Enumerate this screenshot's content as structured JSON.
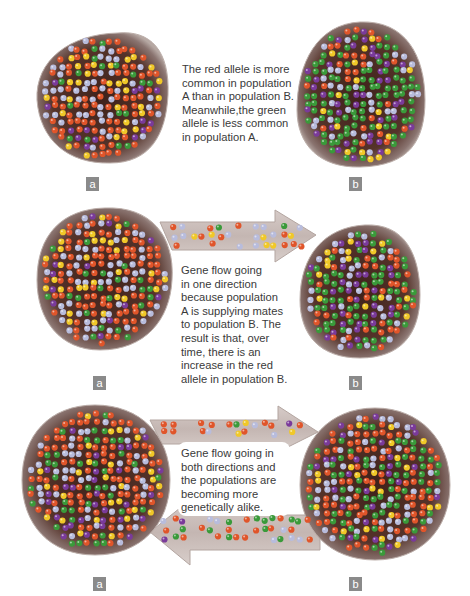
{
  "figure": {
    "colors": {
      "background": "#ffffff",
      "population_fill_inner": "#4a2a22",
      "population_fill_outer": "#9a8680",
      "population_edge": "#b7a9a4",
      "arrow_fill": "#c9bcb8",
      "arrow_edge": "#b3a5a0",
      "label_box": "#8a8a8a",
      "text": "#3a3a3a"
    },
    "alleles": [
      {
        "name": "red",
        "color": "#e0552a"
      },
      {
        "name": "green",
        "color": "#3a9a3a"
      },
      {
        "name": "purple",
        "color": "#7a3a9a"
      },
      {
        "name": "yellow",
        "color": "#f0c828"
      },
      {
        "name": "lavender",
        "color": "#b8bcdc"
      }
    ],
    "panels": [
      {
        "id": "no-gene-flow",
        "caption": "The red allele is more\ncommon in population\nA than in population B.\nMeanwhile,the green\nallele is less common\nin population A.",
        "label_a": "a",
        "label_b": "b",
        "population_a_mix": {
          "red": 0.45,
          "green": 0.12,
          "purple": 0.08,
          "yellow": 0.15,
          "lavender": 0.2
        },
        "population_b_mix": {
          "red": 0.12,
          "green": 0.42,
          "purple": 0.2,
          "yellow": 0.1,
          "lavender": 0.16
        }
      },
      {
        "id": "one-direction",
        "caption": "Gene flow going\nin one direction\nbecause population\nA is supplying mates\nto population B. The\nresult is that, over\ntime, there is an\nincrease in the red\nallele in population B.",
        "label_a": "a",
        "label_b": "b",
        "arrow_direction": "a-to-b",
        "population_a_mix": {
          "red": 0.5,
          "green": 0.1,
          "purple": 0.07,
          "yellow": 0.13,
          "lavender": 0.2
        },
        "population_b_mix": {
          "red": 0.2,
          "green": 0.38,
          "purple": 0.18,
          "yellow": 0.1,
          "lavender": 0.14
        },
        "arrow_mix": {
          "red": 0.6,
          "green": 0.05,
          "purple": 0.0,
          "yellow": 0.12,
          "lavender": 0.23
        }
      },
      {
        "id": "both-directions",
        "caption": "Gene flow going in\nboth directions and\nthe populations are\nbecoming more\n genetically alike.",
        "label_a": "a",
        "label_b": "b",
        "arrow_direction": "both",
        "population_a_mix": {
          "red": 0.38,
          "green": 0.2,
          "purple": 0.1,
          "yellow": 0.14,
          "lavender": 0.18
        },
        "population_b_mix": {
          "red": 0.34,
          "green": 0.24,
          "purple": 0.12,
          "yellow": 0.12,
          "lavender": 0.18
        },
        "arrow_mix": {
          "red": 0.35,
          "green": 0.25,
          "purple": 0.12,
          "yellow": 0.12,
          "lavender": 0.16
        }
      }
    ]
  }
}
